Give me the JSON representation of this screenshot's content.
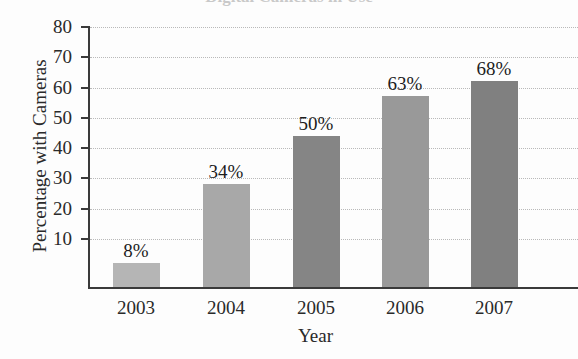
{
  "figure": {
    "partial_title": "Digital Cameras in Use",
    "background_color": "#fdfdfd"
  },
  "chart_data": {
    "type": "bar",
    "title": "",
    "xlabel": "Year",
    "ylabel": "Percentage with Cameras",
    "categories": [
      "2003",
      "2004",
      "2005",
      "2006",
      "2007"
    ],
    "values": [
      8,
      34,
      50,
      63,
      68
    ],
    "data_labels": [
      "8%",
      "34%",
      "50%",
      "63%",
      "68%"
    ],
    "bar_colors": [
      "#b5b5b5",
      "#a8a8a8",
      "#858585",
      "#999999",
      "#808080"
    ],
    "ylim": [
      0,
      80
    ],
    "yticks": [
      10,
      20,
      30,
      40,
      50,
      60,
      70,
      80
    ],
    "ytick_labels": [
      "10",
      "20",
      "30",
      "40",
      "50",
      "60",
      "70",
      "80"
    ],
    "grid": "horizontal-dotted",
    "legend": "none",
    "axis_color": "#3a3a3a",
    "gridline_color": "#b9b9b9"
  }
}
